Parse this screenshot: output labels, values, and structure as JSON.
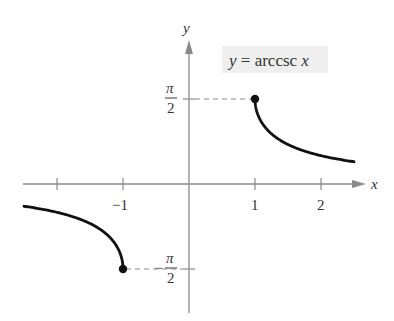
{
  "chart_data": {
    "type": "line",
    "title": "y = arccsc x",
    "xlabel": "x",
    "ylabel": "y",
    "xlim": [
      -2.5,
      2.6
    ],
    "ylim": [
      -1.9,
      2.1
    ],
    "grid": false,
    "legend": "none",
    "x_ticks": [
      {
        "value": -2,
        "label": ""
      },
      {
        "value": -1,
        "label": "−1"
      },
      {
        "value": 1,
        "label": "1"
      },
      {
        "value": 2,
        "label": "2"
      }
    ],
    "y_ticks": [
      {
        "value": 1.5708,
        "label_num": "π",
        "label_den": "2",
        "sign": ""
      },
      {
        "value": -1.5708,
        "label_num": "π",
        "label_den": "2",
        "sign": "−"
      }
    ],
    "series": [
      {
        "name": "arccsc x (x ≥ 1)",
        "x": [
          1,
          1.02,
          1.05,
          1.1,
          1.2,
          1.35,
          1.5,
          1.75,
          2,
          2.25,
          2.5
        ],
        "y": [
          1.5708,
          1.3705,
          1.2606,
          1.1411,
          0.9851,
          0.8338,
          0.7297,
          0.6082,
          0.5236,
          0.4606,
          0.4115
        ],
        "endpoint": {
          "x": 1,
          "y": 1.5708,
          "closed": true
        }
      },
      {
        "name": "arccsc x (x ≤ −1)",
        "x": [
          -2.5,
          -2.25,
          -2,
          -1.75,
          -1.5,
          -1.35,
          -1.2,
          -1.1,
          -1.05,
          -1.02,
          -1
        ],
        "y": [
          -0.4115,
          -0.4606,
          -0.5236,
          -0.6082,
          -0.7297,
          -0.8338,
          -0.9851,
          -1.1411,
          -1.2606,
          -1.3705,
          -1.5708
        ],
        "endpoint": {
          "x": -1,
          "y": -1.5708,
          "closed": true
        }
      }
    ],
    "annotations": [
      {
        "type": "dashed-line",
        "from": [
          0,
          1.5708
        ],
        "to": [
          1,
          1.5708
        ]
      },
      {
        "type": "dashed-line",
        "from": [
          -1,
          -1.5708
        ],
        "to": [
          0,
          -1.5708
        ]
      }
    ]
  },
  "labels": {
    "title_y": "y",
    "title_eq": " = arccsc ",
    "title_x": "x",
    "x_axis": "x",
    "y_axis": "y",
    "tick_neg1": "−1",
    "tick_1": "1",
    "tick_2": "2",
    "pi": "π",
    "two": "2",
    "minus": "−"
  },
  "colors": {
    "axis": "#8a8a8a",
    "curve": "#111111",
    "label_box": "#efefef"
  }
}
